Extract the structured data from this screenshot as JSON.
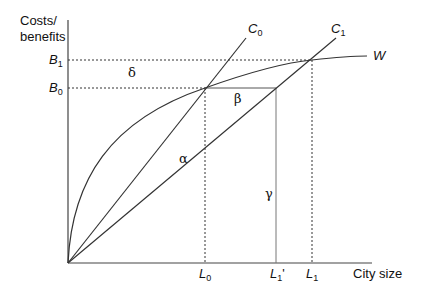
{
  "diagram": {
    "type": "economic-diagram",
    "axes": {
      "y_label_line1": "Costs/",
      "y_label_line2": "benefits",
      "x_label": "City size"
    },
    "y_ticks": [
      {
        "base": "B",
        "sub": "1"
      },
      {
        "base": "B",
        "sub": "0"
      }
    ],
    "x_ticks": [
      {
        "base": "L",
        "sub": "0",
        "prime": ""
      },
      {
        "base": "L",
        "sub": "1",
        "prime": "'"
      },
      {
        "base": "L",
        "sub": "1",
        "prime": ""
      }
    ],
    "curves": [
      {
        "base": "C",
        "sub": "0"
      },
      {
        "base": "C",
        "sub": "1"
      },
      {
        "base": "W",
        "sub": ""
      }
    ],
    "regions": {
      "delta": "δ",
      "beta": "β",
      "alpha": "α",
      "gamma": "γ"
    },
    "colors": {
      "line": "#333333",
      "background": "#ffffff"
    }
  }
}
